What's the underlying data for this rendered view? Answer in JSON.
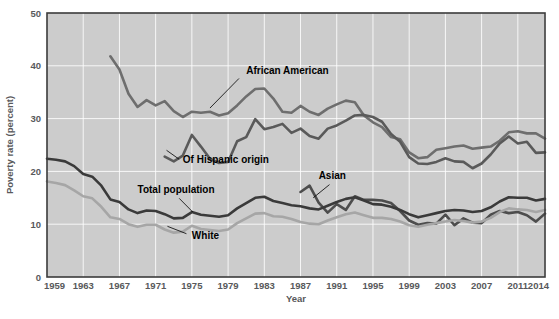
{
  "chart_data": {
    "type": "line",
    "title": "",
    "xlabel": "Year",
    "ylabel": "Poverty rate (percent)",
    "xlim": [
      1959,
      2014
    ],
    "ylim": [
      0,
      50
    ],
    "grid": true,
    "legend_position": "inline-annotations",
    "x_tick_labels": [
      "1959",
      "1963",
      "1967",
      "1971",
      "1975",
      "1979",
      "1983",
      "1987",
      "1991",
      "1995",
      "1999",
      "2003",
      "2007",
      "2011",
      "2014"
    ],
    "x_ticks": [
      1959,
      1963,
      1967,
      1971,
      1975,
      1979,
      1983,
      1987,
      1991,
      1995,
      1999,
      2003,
      2007,
      2011,
      2014
    ],
    "y_tick_labels": [
      "0",
      "10",
      "20",
      "30",
      "40",
      "50"
    ],
    "y_ticks": [
      0,
      10,
      20,
      30,
      40,
      50
    ],
    "series": [
      {
        "name": "African American",
        "color": "#6e6e6e",
        "width": 2.6,
        "label_x": 1981,
        "label_y": 38.5,
        "x": [
          1966,
          1967,
          1968,
          1969,
          1970,
          1971,
          1972,
          1973,
          1974,
          1975,
          1976,
          1977,
          1978,
          1979,
          1980,
          1981,
          1982,
          1983,
          1984,
          1985,
          1986,
          1987,
          1988,
          1989,
          1990,
          1991,
          1992,
          1993,
          1994,
          1995,
          1996,
          1997,
          1998,
          1999,
          2000,
          2001,
          2002,
          2003,
          2004,
          2005,
          2006,
          2007,
          2008,
          2009,
          2010,
          2011,
          2012,
          2013,
          2014
        ],
        "y": [
          41.8,
          39.3,
          34.7,
          32.2,
          33.5,
          32.5,
          33.3,
          31.4,
          30.3,
          31.3,
          31.1,
          31.3,
          30.6,
          31.0,
          32.5,
          34.2,
          35.6,
          35.7,
          33.8,
          31.3,
          31.1,
          32.4,
          31.3,
          30.7,
          31.9,
          32.7,
          33.4,
          33.1,
          30.6,
          29.3,
          28.4,
          26.5,
          26.1,
          23.6,
          22.5,
          22.7,
          24.1,
          24.4,
          24.7,
          24.9,
          24.3,
          24.5,
          24.7,
          25.8,
          27.4,
          27.6,
          27.2,
          27.2,
          26.2
        ]
      },
      {
        "name": "Of Hispanic origin",
        "color": "#5a5a5a",
        "width": 2.6,
        "label_x": 1974,
        "label_y": 21.5,
        "x": [
          1972,
          1973,
          1974,
          1975,
          1976,
          1977,
          1978,
          1979,
          1980,
          1981,
          1982,
          1983,
          1984,
          1985,
          1986,
          1987,
          1988,
          1989,
          1990,
          1991,
          1992,
          1993,
          1994,
          1995,
          1996,
          1997,
          1998,
          1999,
          2000,
          2001,
          2002,
          2003,
          2004,
          2005,
          2006,
          2007,
          2008,
          2009,
          2010,
          2011,
          2012,
          2013,
          2014
        ],
        "y": [
          22.8,
          21.9,
          23.0,
          26.9,
          24.7,
          22.4,
          21.6,
          21.8,
          25.7,
          26.5,
          29.9,
          28.0,
          28.4,
          29.0,
          27.3,
          28.1,
          26.7,
          26.2,
          28.1,
          28.7,
          29.6,
          30.6,
          30.7,
          30.3,
          29.4,
          27.1,
          25.6,
          22.7,
          21.5,
          21.4,
          21.8,
          22.5,
          21.9,
          21.8,
          20.6,
          21.5,
          23.2,
          25.3,
          26.6,
          25.3,
          25.6,
          23.5,
          23.6
        ]
      },
      {
        "name": "Asian",
        "color": "#4d4d4d",
        "width": 2.6,
        "label_x": 1989,
        "label_y": 18.5,
        "x": [
          1987,
          1988,
          1989,
          1990,
          1991,
          1992,
          1993,
          1994,
          1995,
          1996,
          1997,
          1998,
          1999,
          2000,
          2001,
          2002,
          2003,
          2004,
          2005,
          2006,
          2007,
          2008,
          2009,
          2010,
          2011,
          2012,
          2013,
          2014
        ],
        "y": [
          16.1,
          17.3,
          14.1,
          12.2,
          13.8,
          12.7,
          15.3,
          14.6,
          14.6,
          14.5,
          14.0,
          12.5,
          10.7,
          9.9,
          10.2,
          10.1,
          11.8,
          9.8,
          11.1,
          10.3,
          10.2,
          11.8,
          12.5,
          12.1,
          12.3,
          11.7,
          10.5,
          12.0
        ]
      },
      {
        "name": "Total population",
        "color": "#3a3a3a",
        "width": 2.6,
        "label_x": 1969,
        "label_y": 16.0,
        "x": [
          1959,
          1960,
          1961,
          1962,
          1963,
          1964,
          1965,
          1966,
          1967,
          1968,
          1969,
          1970,
          1971,
          1972,
          1973,
          1974,
          1975,
          1976,
          1977,
          1978,
          1979,
          1980,
          1981,
          1982,
          1983,
          1984,
          1985,
          1986,
          1987,
          1988,
          1989,
          1990,
          1991,
          1992,
          1993,
          1994,
          1995,
          1996,
          1997,
          1998,
          1999,
          2000,
          2001,
          2002,
          2003,
          2004,
          2005,
          2006,
          2007,
          2008,
          2009,
          2010,
          2011,
          2012,
          2013,
          2014
        ],
        "y": [
          22.4,
          22.2,
          21.9,
          21.0,
          19.5,
          19.0,
          17.3,
          14.7,
          14.2,
          12.8,
          12.1,
          12.6,
          12.5,
          11.9,
          11.1,
          11.2,
          12.3,
          11.8,
          11.6,
          11.4,
          11.7,
          13.0,
          14.0,
          15.0,
          15.2,
          14.4,
          14.0,
          13.6,
          13.4,
          13.0,
          12.8,
          13.5,
          14.2,
          14.8,
          15.1,
          14.5,
          13.8,
          13.7,
          13.3,
          12.7,
          11.9,
          11.3,
          11.7,
          12.1,
          12.5,
          12.7,
          12.6,
          12.3,
          12.5,
          13.2,
          14.3,
          15.1,
          15.0,
          15.0,
          14.5,
          14.8
        ]
      },
      {
        "name": "White",
        "color": "#a6a6a6",
        "width": 2.6,
        "label_x": 1975,
        "label_y": 7.2,
        "x": [
          1959,
          1960,
          1961,
          1962,
          1963,
          1964,
          1965,
          1966,
          1967,
          1968,
          1969,
          1970,
          1971,
          1972,
          1973,
          1974,
          1975,
          1976,
          1977,
          1978,
          1979,
          1980,
          1981,
          1982,
          1983,
          1984,
          1985,
          1986,
          1987,
          1988,
          1989,
          1990,
          1991,
          1992,
          1993,
          1994,
          1995,
          1996,
          1997,
          1998,
          1999,
          2000,
          2001,
          2002,
          2003,
          2004,
          2005,
          2006,
          2007,
          2008,
          2009,
          2010,
          2011,
          2012,
          2013,
          2014
        ],
        "y": [
          18.1,
          17.8,
          17.4,
          16.4,
          15.3,
          14.9,
          13.3,
          11.3,
          11.0,
          10.0,
          9.5,
          9.9,
          9.9,
          9.0,
          8.4,
          8.6,
          9.7,
          9.1,
          8.9,
          8.7,
          9.0,
          10.2,
          11.1,
          12.0,
          12.1,
          11.5,
          11.4,
          11.0,
          10.4,
          10.1,
          10.0,
          10.7,
          11.3,
          11.9,
          12.2,
          11.7,
          11.2,
          11.2,
          11.0,
          10.5,
          9.8,
          9.5,
          9.9,
          10.2,
          10.5,
          10.8,
          10.6,
          10.3,
          10.5,
          11.2,
          12.3,
          13.0,
          12.8,
          12.7,
          12.3,
          12.7
        ]
      }
    ]
  },
  "annotations": [
    {
      "text": "African American"
    },
    {
      "text": "Of Hispanic origin"
    },
    {
      "text": "Asian"
    },
    {
      "text": "Total population"
    },
    {
      "text": "White"
    }
  ],
  "colors": {
    "plot_background": "#cccccc",
    "plot_border": "#3b3b3b",
    "gridline": "#ffffff",
    "tick_text": "#58595b",
    "annotation_text": "#000000"
  }
}
